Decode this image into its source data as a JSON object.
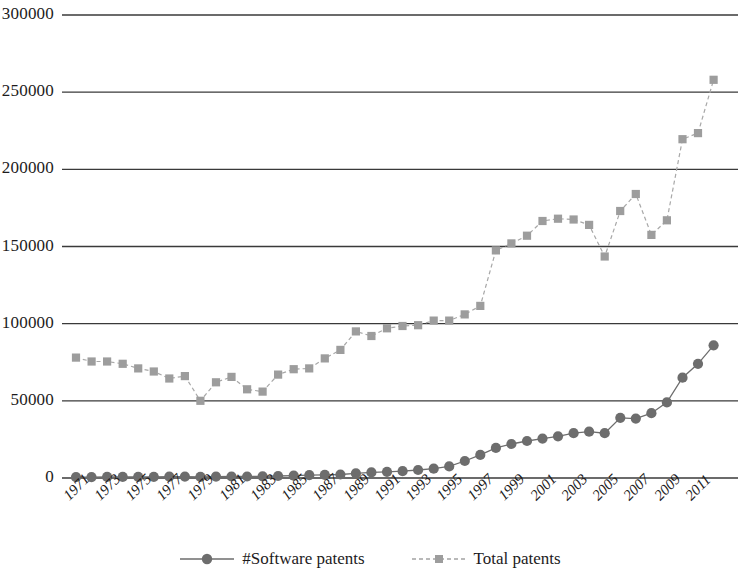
{
  "chart_data": {
    "type": "line",
    "title": "",
    "subtitle": "",
    "xlabel": "",
    "ylabel": "",
    "xlim": [
      1971,
      2012
    ],
    "ylim": [
      0,
      300000
    ],
    "grid": true,
    "grid_axis": "y",
    "legend_position": "bottom",
    "y_ticks": [
      0,
      50000,
      100000,
      150000,
      200000,
      250000,
      300000
    ],
    "y_tick_labels": [
      "0",
      "50000",
      "100000",
      "150000",
      "200000",
      "250000",
      "300000"
    ],
    "x": [
      1971,
      1972,
      1973,
      1974,
      1975,
      1976,
      1977,
      1978,
      1979,
      1980,
      1981,
      1982,
      1983,
      1984,
      1985,
      1986,
      1987,
      1988,
      1989,
      1990,
      1991,
      1992,
      1993,
      1994,
      1995,
      1996,
      1997,
      1998,
      1999,
      2000,
      2001,
      2002,
      2003,
      2004,
      2005,
      2006,
      2007,
      2008,
      2009,
      2010,
      2011,
      2012
    ],
    "x_tick_labels": [
      "1971",
      "1973",
      "1975",
      "1977",
      "1979",
      "1981",
      "1983",
      "1985",
      "1987",
      "1989",
      "1991",
      "1993",
      "1995",
      "1997",
      "1999",
      "2001",
      "2003",
      "2005",
      "2007",
      "2009",
      "2011"
    ],
    "series": [
      {
        "name": "#Software patents",
        "color": "#6d6d6d",
        "marker": "circle",
        "linestyle": "solid",
        "values": [
          500,
          600,
          700,
          700,
          800,
          800,
          900,
          900,
          800,
          900,
          1000,
          1000,
          1100,
          1300,
          1500,
          1800,
          2000,
          2300,
          3000,
          3600,
          4000,
          4400,
          5200,
          6000,
          7500,
          11000,
          15000,
          19500,
          22000,
          24000,
          25500,
          27000,
          29000,
          30000,
          29000,
          39000,
          38500,
          42000,
          49000,
          65000,
          74000,
          86000
        ]
      },
      {
        "name": "Total patents",
        "color": "#9d9d9d",
        "marker": "square",
        "linestyle": "dashed",
        "values": [
          78000,
          75500,
          75500,
          74000,
          71000,
          69000,
          64500,
          66000,
          50000,
          62000,
          65500,
          57500,
          56000,
          67000,
          70500,
          71000,
          77500,
          83000,
          95000,
          92000,
          97000,
          98500,
          99000,
          102000,
          102000,
          106000,
          111500,
          147500,
          152000,
          157000,
          166500,
          168000,
          167500,
          164000,
          143500,
          173000,
          184000,
          157500,
          167000,
          219500,
          223500,
          258000
        ]
      }
    ]
  },
  "legend": {
    "entries": [
      {
        "label": "#Software patents",
        "marker": "circle-marker",
        "line": "solid-line"
      },
      {
        "label": "Total patents",
        "marker": "square-marker",
        "line": "dashed-line"
      }
    ]
  }
}
